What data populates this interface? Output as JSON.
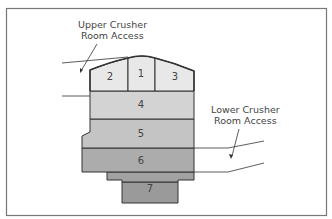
{
  "diagram": {
    "labels": {
      "upper_access_line1": "Upper Crusher",
      "upper_access_line2": "Room Access",
      "lower_access_line1": "Lower Crusher",
      "lower_access_line2": "Room Access"
    },
    "zones": [
      {
        "id": "1",
        "label": "1",
        "fill": "#e8e8e8"
      },
      {
        "id": "2",
        "label": "2",
        "fill": "#e8e8e8"
      },
      {
        "id": "3",
        "label": "3",
        "fill": "#e8e8e8"
      },
      {
        "id": "4",
        "label": "4",
        "fill": "#d3d3d3"
      },
      {
        "id": "5",
        "label": "5",
        "fill": "#c4c4c4"
      },
      {
        "id": "6",
        "label": "6",
        "fill": "#acacac"
      },
      {
        "id": "7",
        "label": "7",
        "fill": "#9a9a9a"
      }
    ],
    "colors": {
      "frame": "#777777",
      "outline": "#333333",
      "text": "#444444"
    }
  }
}
